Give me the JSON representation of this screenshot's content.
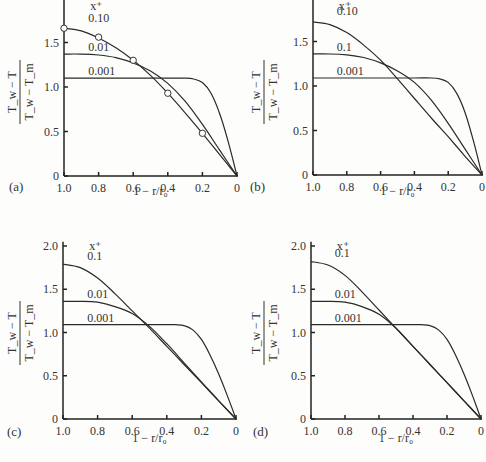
{
  "figure": {
    "ylabel_num": "T_w − T",
    "ylabel_den": "T_w − T_m",
    "xlabel": "1 − r/r₀",
    "legend_title": "x⁺"
  },
  "chart_data": [
    {
      "type": "line",
      "panel": "(a)",
      "xlabel": "1 − r/r0",
      "ylabel": "(Tw − T)/(Tw − Tm)",
      "xlim": [
        1.0,
        0
      ],
      "ylim": [
        0,
        2.0
      ],
      "xticks": [
        "1.0",
        "0.8",
        "0.6",
        "0.4",
        "0.2",
        "0"
      ],
      "yticks": [
        "0",
        "0.5",
        "1.0",
        "1.5"
      ],
      "legend_title": "x⁺",
      "series": [
        {
          "name": "0.10",
          "x": [
            1.0,
            0.9,
            0.8,
            0.7,
            0.6,
            0.5,
            0.4,
            0.3,
            0.2,
            0.1,
            0.0
          ],
          "y": [
            1.66,
            1.63,
            1.55,
            1.44,
            1.3,
            1.13,
            0.93,
            0.71,
            0.48,
            0.24,
            0.0
          ]
        },
        {
          "name": "0.01",
          "x": [
            1.0,
            0.9,
            0.8,
            0.7,
            0.6,
            0.5,
            0.4,
            0.3,
            0.2,
            0.1,
            0.0
          ],
          "y": [
            1.37,
            1.37,
            1.36,
            1.33,
            1.27,
            1.18,
            1.04,
            0.84,
            0.58,
            0.29,
            0.0
          ]
        },
        {
          "name": "0.001",
          "x": [
            1.0,
            0.8,
            0.6,
            0.4,
            0.3,
            0.25,
            0.2,
            0.15,
            0.1,
            0.05,
            0.0
          ],
          "y": [
            1.1,
            1.1,
            1.1,
            1.1,
            1.1,
            1.09,
            1.05,
            0.93,
            0.7,
            0.38,
            0.0
          ]
        }
      ],
      "markers": {
        "x": [
          1.0,
          0.8,
          0.6,
          0.4,
          0.2
        ],
        "y": [
          1.66,
          1.56,
          1.3,
          0.93,
          0.48
        ]
      }
    },
    {
      "type": "line",
      "panel": "(b)",
      "xlabel": "1 − r/r0",
      "ylabel": "(Tw − T)/(Tw − Tm)",
      "xlim": [
        1.0,
        0
      ],
      "ylim": [
        0,
        2.0
      ],
      "xticks": [
        "1.0",
        "0.8",
        "0.6",
        "0.4",
        "0.2",
        "0"
      ],
      "yticks": [
        "0",
        "0.5",
        "1.0",
        "1.5"
      ],
      "legend_title": "x⁺",
      "series": [
        {
          "name": "0.10",
          "x": [
            1.0,
            0.9,
            0.8,
            0.7,
            0.6,
            0.5,
            0.4,
            0.3,
            0.2,
            0.1,
            0.0
          ],
          "y": [
            1.72,
            1.69,
            1.6,
            1.46,
            1.29,
            1.08,
            0.86,
            0.64,
            0.43,
            0.21,
            0.0
          ]
        },
        {
          "name": "0.1",
          "x": [
            1.0,
            0.9,
            0.8,
            0.7,
            0.6,
            0.5,
            0.4,
            0.3,
            0.2,
            0.1,
            0.0
          ],
          "y": [
            1.36,
            1.36,
            1.35,
            1.32,
            1.26,
            1.17,
            1.04,
            0.84,
            0.58,
            0.29,
            0.0
          ]
        },
        {
          "name": "0.001",
          "x": [
            1.0,
            0.8,
            0.6,
            0.4,
            0.3,
            0.25,
            0.2,
            0.15,
            0.1,
            0.05,
            0.0
          ],
          "y": [
            1.09,
            1.09,
            1.09,
            1.09,
            1.09,
            1.08,
            1.04,
            0.92,
            0.7,
            0.38,
            0.0
          ]
        }
      ]
    },
    {
      "type": "line",
      "panel": "(c)",
      "xlabel": "1 − r/r0",
      "ylabel": "(Tw − T)/(Tw − Tm)",
      "xlim": [
        1.0,
        0
      ],
      "ylim": [
        0,
        2.0
      ],
      "xticks": [
        "1.0",
        "0.8",
        "0.6",
        "0.4",
        "0.2",
        "0"
      ],
      "yticks": [
        "0",
        "0.5",
        "1.0",
        "1.5",
        "2.0"
      ],
      "legend_title": "x⁺",
      "series": [
        {
          "name": "0.1",
          "x": [
            1.0,
            0.9,
            0.8,
            0.7,
            0.6,
            0.5,
            0.4,
            0.3,
            0.2,
            0.1,
            0.0
          ],
          "y": [
            1.79,
            1.75,
            1.63,
            1.45,
            1.25,
            1.05,
            0.84,
            0.63,
            0.42,
            0.21,
            0.0
          ]
        },
        {
          "name": "0.01",
          "x": [
            1.0,
            0.9,
            0.8,
            0.7,
            0.6,
            0.5,
            0.4,
            0.3,
            0.2,
            0.1,
            0.0
          ],
          "y": [
            1.36,
            1.36,
            1.35,
            1.3,
            1.22,
            1.07,
            0.87,
            0.65,
            0.43,
            0.21,
            0.0
          ]
        },
        {
          "name": "0.001",
          "x": [
            1.0,
            0.8,
            0.6,
            0.4,
            0.35,
            0.3,
            0.25,
            0.2,
            0.15,
            0.1,
            0.05,
            0.0
          ],
          "y": [
            1.09,
            1.09,
            1.09,
            1.09,
            1.09,
            1.08,
            1.03,
            0.92,
            0.74,
            0.52,
            0.27,
            0.0
          ]
        }
      ]
    },
    {
      "type": "line",
      "panel": "(d)",
      "xlabel": "1 − r/r0",
      "ylabel": "(Tw − T)/(Tw − Tm)",
      "xlim": [
        1.0,
        0
      ],
      "ylim": [
        0,
        2.0
      ],
      "xticks": [
        "1.0",
        "0.8",
        "0.6",
        "0.4",
        "0.2",
        "0"
      ],
      "yticks": [
        "0",
        "0.5",
        "1.0",
        "1.5",
        "2.0"
      ],
      "legend_title": "x⁺",
      "series": [
        {
          "name": "0.1",
          "x": [
            1.0,
            0.9,
            0.8,
            0.7,
            0.6,
            0.5,
            0.4,
            0.3,
            0.2,
            0.1,
            0.0
          ],
          "y": [
            1.82,
            1.78,
            1.66,
            1.47,
            1.26,
            1.05,
            0.84,
            0.63,
            0.42,
            0.21,
            0.0
          ]
        },
        {
          "name": "0.01",
          "x": [
            1.0,
            0.9,
            0.8,
            0.7,
            0.6,
            0.5,
            0.4,
            0.3,
            0.2,
            0.1,
            0.0
          ],
          "y": [
            1.36,
            1.36,
            1.35,
            1.3,
            1.21,
            1.05,
            0.84,
            0.63,
            0.42,
            0.21,
            0.0
          ]
        },
        {
          "name": "0.001",
          "x": [
            1.0,
            0.8,
            0.6,
            0.4,
            0.35,
            0.3,
            0.25,
            0.2,
            0.15,
            0.1,
            0.05,
            0.0
          ],
          "y": [
            1.09,
            1.09,
            1.09,
            1.09,
            1.09,
            1.08,
            1.03,
            0.92,
            0.74,
            0.52,
            0.27,
            0.0
          ]
        }
      ]
    }
  ]
}
